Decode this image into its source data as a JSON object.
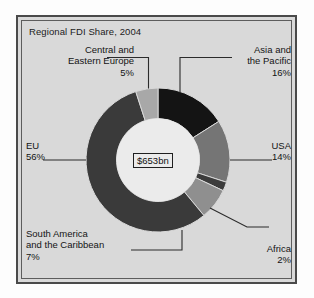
{
  "chart_data": {
    "type": "pie",
    "variant": "donut",
    "title": "Regional FDI Share, 2004",
    "center_label": "$653bn",
    "xlabel": "",
    "ylabel": "",
    "legend_position": "callout-labels",
    "grid": false,
    "unit": "%",
    "total": "$653bn",
    "start_angle_deg": 0,
    "direction": "clockwise",
    "categories": [
      "Asia and the Pacific",
      "USA",
      "Africa",
      "South America and the Caribbean",
      "EU",
      "Central and Eastern Europe"
    ],
    "values": [
      16,
      14,
      2,
      7,
      56,
      5
    ],
    "slices": [
      {
        "name": "Asia and the Pacific",
        "label_line1": "Asia and",
        "label_line2": "the Pacific",
        "value": 16,
        "value_text": "16%",
        "color": "#141414",
        "position": "top-right"
      },
      {
        "name": "USA",
        "label_line1": "USA",
        "label_line2": "",
        "value": 14,
        "value_text": "14%",
        "color": "#757575",
        "position": "right"
      },
      {
        "name": "Africa",
        "label_line1": "Africa",
        "label_line2": "",
        "value": 2,
        "value_text": "2%",
        "color": "#3c3c3c",
        "position": "bottom-right"
      },
      {
        "name": "South America and the Caribbean",
        "label_line1": "South America",
        "label_line2": "and the Caribbean",
        "value": 7,
        "value_text": "7%",
        "color": "#8f8f8f",
        "position": "bottom-left"
      },
      {
        "name": "EU",
        "label_line1": "EU",
        "label_line2": "",
        "value": 56,
        "value_text": "56%",
        "color": "#3a3a3a",
        "position": "left"
      },
      {
        "name": "Central and Eastern Europe",
        "label_line1": "Central and",
        "label_line2": "Eastern Europe",
        "value": 5,
        "value_text": "5%",
        "color": "#a8a8a8",
        "position": "top-left"
      }
    ]
  },
  "colors": {
    "panel_background": "#d9d9d9",
    "frame": "#4a4a4a",
    "text": "#141414",
    "center_box_fill": "#ebebeb",
    "donut_hole": "#ebebeb",
    "leader_line": "#2b2b2b"
  },
  "labels": {
    "title": "Regional FDI Share, 2004",
    "center_total": "$653bn",
    "ceurope_l1": "Central and",
    "ceurope_l2": "Eastern Europe",
    "ceurope_pct": "5%",
    "asia_l1": "Asia and",
    "asia_l2": "the Pacific",
    "asia_pct": "16%",
    "eu_l1": "EU",
    "eu_pct": "56%",
    "usa_l1": "USA",
    "usa_pct": "14%",
    "sam_l1": "South America",
    "sam_l2": "and the Caribbean",
    "sam_pct": "7%",
    "africa_l1": "Africa",
    "africa_pct": "2%"
  }
}
